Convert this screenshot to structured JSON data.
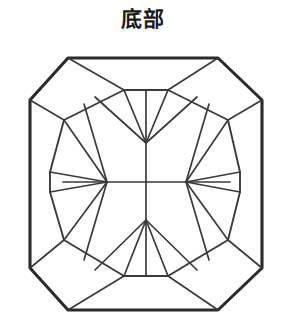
{
  "figure": {
    "title": "底部",
    "kind": "gemstone-pavilion-facet-diagram",
    "canvas": {
      "width": 286,
      "height": 336
    },
    "colors": {
      "background": "#ffffff",
      "outline_stroke": "#2b2b2b",
      "facet_stroke": "#3a3a3a",
      "title_text": "#1b1b1b",
      "facet_fill": "#ffffff"
    },
    "stroke_widths": {
      "outline": 3.1,
      "girdle_ring": 1.9,
      "facet": 1.7
    },
    "outline": {
      "label": "cut-corner octagonal girdle outline",
      "points": "68,58 218,58 262,100 262,268 218,310 68,310 30,268 30,100"
    },
    "inner_ring": {
      "label": "inner pavilion girdle ring",
      "points": "124,90 168,90 228,120 240,172 240,192 228,240 168,276 124,276 64,240 50,192 50,172 64,120"
    },
    "hubs": {
      "label": "pavilion culet hub points",
      "top": {
        "x": 146,
        "y": 143
      },
      "left": {
        "x": 107,
        "y": 182
      },
      "right": {
        "x": 186,
        "y": 182
      },
      "bottom": {
        "x": 146,
        "y": 220
      }
    },
    "cross_lines": {
      "vertical": "146,143 146,220",
      "horizontal": "107,182 186,182",
      "left_stub": "63,182 107,182",
      "right_stub": "186,182 230,182"
    },
    "corner_spokes": [
      "68,58 124,90",
      "218,58 168,90",
      "262,100 228,120",
      "262,268 228,240",
      "218,310 168,276",
      "68,310 124,276",
      "30,268 64,240",
      "30,100 64,120"
    ],
    "top_fan": [
      "146,143 124,90",
      "146,143 168,90",
      "146,143 95,97",
      "146,143 197,97",
      "146,143 146,90"
    ],
    "bottom_fan": [
      "146,220 124,276",
      "146,220 168,276",
      "146,220 95,270",
      "146,220 197,270",
      "146,220 146,276"
    ],
    "left_fan": [
      "107,182 64,120",
      "107,182 50,172",
      "107,182 50,192",
      "107,182 64,240",
      "107,182 84,104",
      "107,182 84,260"
    ],
    "right_fan": [
      "186,182 228,120",
      "186,182 240,172",
      "186,182 240,192",
      "186,182 228,240",
      "186,182 209,104",
      "186,182 209,260"
    ],
    "girdle_arcs": [
      "124,90 146,96 168,90",
      "124,276 146,270 168,276"
    ],
    "facet_count_note": "octagonal step-cut pavilion with four-point star hub pattern"
  }
}
